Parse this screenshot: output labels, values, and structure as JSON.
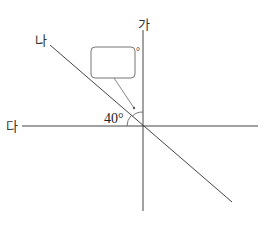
{
  "diagram": {
    "labels": {
      "vertical_line": "가",
      "diagonal_line": "나",
      "horizontal_line": "다"
    },
    "angle_label": "40°",
    "answer_box": {
      "value": "",
      "unit": "°"
    }
  }
}
